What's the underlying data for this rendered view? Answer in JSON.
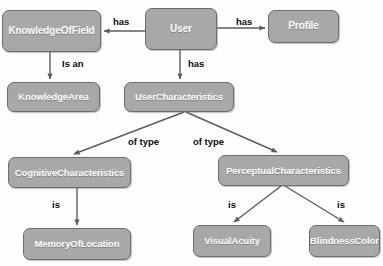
{
  "diagram": {
    "type": "class-hierarchy",
    "canvas": {
      "width": 383,
      "height": 266
    },
    "style": {
      "node_fill": "#a8a8a8",
      "node_border": "#6d6d6d",
      "node_text": "#ffffff",
      "edge_color": "#5d5d5d",
      "label_text": "#0d0d0d",
      "background": "#fdfdfd"
    },
    "nodes": [
      {
        "id": "knowledgeOfField",
        "label": "KnowledgeOfField",
        "x": 2,
        "y": 10,
        "w": 99,
        "h": 42,
        "font_size": 10
      },
      {
        "id": "user",
        "label": "User",
        "x": 145,
        "y": 8,
        "w": 72,
        "h": 42,
        "font_size": 10
      },
      {
        "id": "profile",
        "label": "Profile",
        "x": 268,
        "y": 10,
        "w": 71,
        "h": 33,
        "font_size": 10
      },
      {
        "id": "knowledgeArea",
        "label": "KnowledgeArea",
        "x": 7,
        "y": 82,
        "w": 93,
        "h": 30,
        "font_size": 9.5
      },
      {
        "id": "userCharacteristics",
        "label": "UserCharacteristics",
        "x": 124,
        "y": 82,
        "w": 110,
        "h": 30,
        "font_size": 9.5
      },
      {
        "id": "cognitiveCharacteristics",
        "label": "CognitiveCharacteristics",
        "x": 8,
        "y": 157,
        "w": 123,
        "h": 31,
        "font_size": 9.5
      },
      {
        "id": "perceptualCharacteristics",
        "label": "PerceptualCharacteristics",
        "x": 218,
        "y": 155,
        "w": 131,
        "h": 31,
        "font_size": 9.5
      },
      {
        "id": "memoryOfLocation",
        "label": "MemoryOfLocation",
        "x": 23,
        "y": 228,
        "w": 108,
        "h": 32,
        "font_size": 9.5
      },
      {
        "id": "visualAcuity",
        "label": "VisualAcuity",
        "x": 193,
        "y": 225,
        "w": 78,
        "h": 32,
        "font_size": 9.5
      },
      {
        "id": "blindnessColor",
        "label": "BlindnessColor",
        "x": 309,
        "y": 225,
        "w": 71,
        "h": 32,
        "font_size": 9.5
      }
    ],
    "edges": [
      {
        "id": "user-has-knowledgeOfField",
        "from": "user",
        "to": "knowledgeOfField",
        "label": "has",
        "label_x": 113,
        "label_y": 16
      },
      {
        "id": "user-has-profile",
        "from": "user",
        "to": "profile",
        "label": "has",
        "label_x": 236,
        "label_y": 16
      },
      {
        "id": "knowledgeOfField-isan-knowledgeArea",
        "from": "knowledgeOfField",
        "to": "knowledgeArea",
        "label": "Is an",
        "label_x": 62,
        "label_y": 58
      },
      {
        "id": "user-has-userCharacteristics",
        "from": "user",
        "to": "userCharacteristics",
        "label": "has",
        "label_x": 188,
        "label_y": 58
      },
      {
        "id": "userCharacteristics-oftype-cognitive",
        "from": "userCharacteristics",
        "to": "cognitiveCharacteristics",
        "label": "of type",
        "label_x": 128,
        "label_y": 136
      },
      {
        "id": "userCharacteristics-oftype-perceptual",
        "from": "userCharacteristics",
        "to": "perceptualCharacteristics",
        "label": "of type",
        "label_x": 193,
        "label_y": 136
      },
      {
        "id": "cognitive-is-memoryOfLocation",
        "from": "cognitiveCharacteristics",
        "to": "memoryOfLocation",
        "label": "is",
        "label_x": 52,
        "label_y": 199
      },
      {
        "id": "perceptual-is-visualAcuity",
        "from": "perceptualCharacteristics",
        "to": "visualAcuity",
        "label": "is",
        "label_x": 228,
        "label_y": 199
      },
      {
        "id": "perceptual-is-blindnessColor",
        "from": "perceptualCharacteristics",
        "to": "blindnessColor",
        "label": "is",
        "label_x": 337,
        "label_y": 199
      }
    ]
  }
}
